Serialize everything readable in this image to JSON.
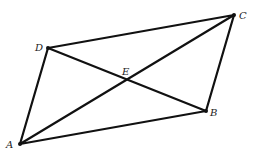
{
  "figure": {
    "type": "parallelogram-with-diagonals",
    "points": {
      "A": {
        "label": "A",
        "x": 20,
        "y": 144,
        "lx": 6,
        "ly": 140
      },
      "B": {
        "label": "B",
        "x": 206,
        "y": 111,
        "lx": 210,
        "ly": 108
      },
      "C": {
        "label": "C",
        "x": 234,
        "y": 15,
        "lx": 239,
        "ly": 11
      },
      "D": {
        "label": "D",
        "x": 48,
        "y": 48,
        "lx": 35,
        "ly": 43
      },
      "E": {
        "label": "E",
        "x": 127,
        "y": 80,
        "lx": 122,
        "ly": 67
      }
    },
    "segments": [
      [
        "A",
        "B"
      ],
      [
        "B",
        "C"
      ],
      [
        "C",
        "D"
      ],
      [
        "D",
        "A"
      ],
      [
        "A",
        "C"
      ],
      [
        "D",
        "B"
      ]
    ],
    "stroke_color": "#111111"
  }
}
